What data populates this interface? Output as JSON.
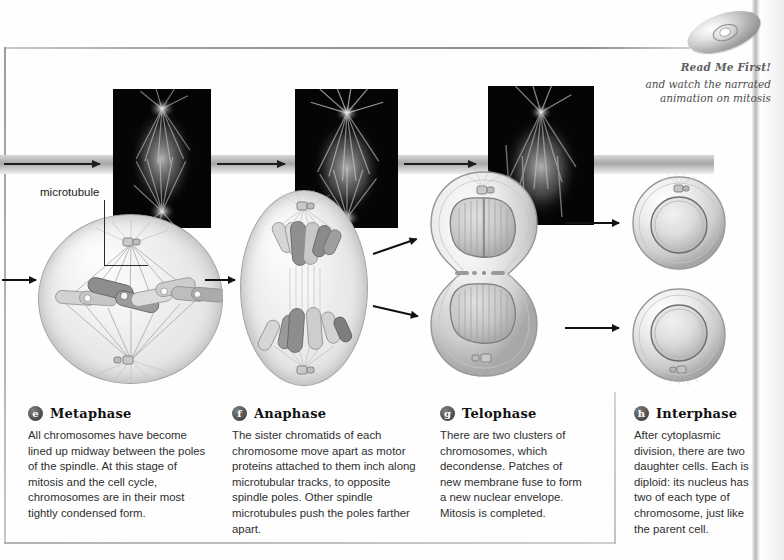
{
  "figure": {
    "readme": {
      "title": "Read Me First!",
      "subtitle_line1": "and watch the narrated",
      "subtitle_line2": "animation on mitosis",
      "disc_icon": "cd-disc-icon"
    },
    "label_microtubule": "microtubule"
  },
  "stages": [
    {
      "badge": "e",
      "name": "Metaphase",
      "body": "All chromosomes have become lined up midway between the poles of the spindle. At this stage of mitosis and the cell cycle, chromosomes are in their most tightly condensed form."
    },
    {
      "badge": "f",
      "name": "Anaphase",
      "body": "The sister chromatids of each chromosome move apart as motor proteins attached to them inch along microtubular tracks, to opposite spindle poles. Other spindle microtubules push the poles farther apart."
    },
    {
      "badge": "g",
      "name": "Telophase",
      "body": "There are two clusters of chromosomes, which decondense. Patches of new membrane fuse to form a new nuclear envelope. Mitosis is completed."
    },
    {
      "badge": "h",
      "name": "Interphase",
      "body": "After cytoplasmic division, there are two daughter cells. Each is diploid: its nucleus has two of each type of chromosome, just like the parent cell."
    }
  ],
  "micrographs": [
    {
      "name": "metaphase-micrograph"
    },
    {
      "name": "anaphase-micrograph"
    },
    {
      "name": "telophase-micrograph"
    }
  ],
  "colors": {
    "background": "#ffffff",
    "frame_line": "#9a9a9a",
    "arrow": "#111111",
    "badge_fill": "#4a4a4a",
    "caption_text": "#2e2e2e",
    "readme_text": "#5f5f5f",
    "micrograph_bg": "#050505",
    "cell_fill": "#e7e7e7"
  }
}
